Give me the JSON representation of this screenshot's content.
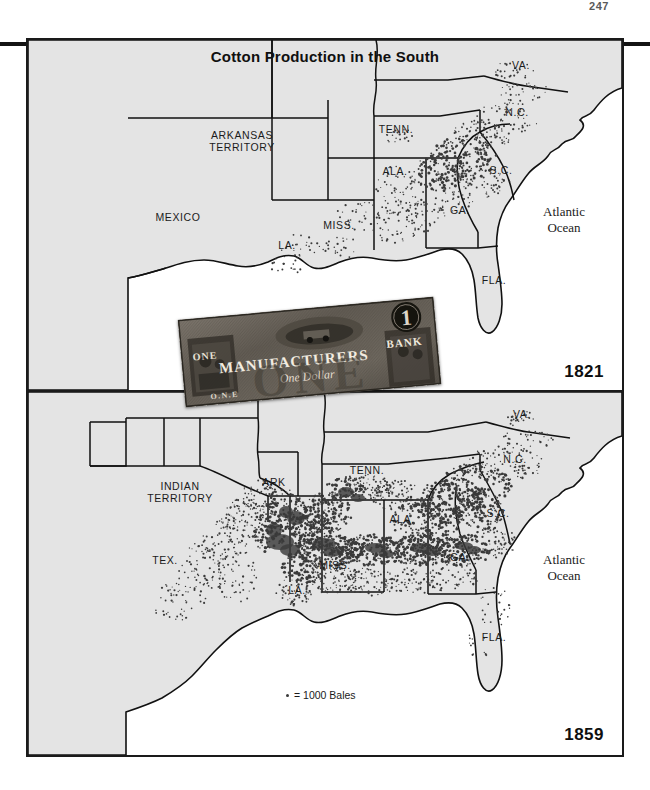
{
  "page": {
    "number": "247"
  },
  "figure": {
    "title": "Cotton Production in the South",
    "legend": {
      "symbol": "dot",
      "text": "= 1000 Bales"
    }
  },
  "maps": [
    {
      "year_label": "1821",
      "ocean_label_line1": "Atlantic",
      "ocean_label_line2": "Ocean",
      "labels": [
        {
          "id": "arkansas-territory",
          "line1": "ARKANSAS",
          "line2": "TERRITORY",
          "x": 214,
          "y": 99
        },
        {
          "id": "mexico",
          "line1": "MEXICO",
          "line2": "",
          "x": 150,
          "y": 181
        },
        {
          "id": "tennessee",
          "line1": "TENN.",
          "line2": "",
          "x": 368,
          "y": 93
        },
        {
          "id": "alabama",
          "line1": "ALA.",
          "line2": "",
          "x": 367,
          "y": 135
        },
        {
          "id": "mississippi",
          "line1": "MISS.",
          "line2": "",
          "x": 311,
          "y": 189
        },
        {
          "id": "louisiana",
          "line1": "LA.",
          "line2": "",
          "x": 259,
          "y": 209
        },
        {
          "id": "georgia",
          "line1": "GA.",
          "line2": "",
          "x": 432,
          "y": 174
        },
        {
          "id": "south-carolina",
          "line1": "S.C.",
          "line2": "",
          "x": 473,
          "y": 134
        },
        {
          "id": "north-carolina",
          "line1": "N.C.",
          "line2": "",
          "x": 489,
          "y": 76
        },
        {
          "id": "virginia",
          "line1": "VA.",
          "line2": "",
          "x": 493,
          "y": 29
        },
        {
          "id": "florida",
          "line1": "FLA.",
          "line2": "",
          "x": 466,
          "y": 244
        }
      ]
    },
    {
      "year_label": "1859",
      "ocean_label_line1": "Atlantic",
      "ocean_label_line2": "Ocean",
      "labels": [
        {
          "id": "indian-territory",
          "line1": "INDIAN",
          "line2": "TERRITORY",
          "x": 152,
          "y": 98
        },
        {
          "id": "texas",
          "line1": "TEX.",
          "line2": "",
          "x": 137,
          "y": 172
        },
        {
          "id": "arkansas",
          "line1": "ARK",
          "line2": "",
          "x": 246,
          "y": 94
        },
        {
          "id": "tennessee",
          "line1": "TENN.",
          "line2": "",
          "x": 339,
          "y": 82
        },
        {
          "id": "alabama",
          "line1": "ALA.",
          "line2": "",
          "x": 374,
          "y": 131
        },
        {
          "id": "mississippi",
          "line1": "MISS.",
          "line2": "",
          "x": 307,
          "y": 177
        },
        {
          "id": "louisiana",
          "line1": "LA.",
          "line2": "",
          "x": 269,
          "y": 202
        },
        {
          "id": "georgia",
          "line1": "GA.",
          "line2": "",
          "x": 432,
          "y": 169
        },
        {
          "id": "south-carolina",
          "line1": "S.C.",
          "line2": "",
          "x": 470,
          "y": 125
        },
        {
          "id": "north-carolina",
          "line1": "N.C.",
          "line2": "",
          "x": 487,
          "y": 71
        },
        {
          "id": "virginia",
          "line1": "VA.",
          "line2": "",
          "x": 494,
          "y": 26
        },
        {
          "id": "florida",
          "line1": "FLA.",
          "line2": "",
          "x": 466,
          "y": 249
        }
      ]
    }
  ],
  "banknote": {
    "title": "MANUFACTURERS",
    "bank_word": "BANK",
    "denomination_numeral": "1",
    "denomination_word": "ONE",
    "denomination_script": "One Dollar",
    "bottom_word": "O.N.E"
  },
  "colors": {
    "land": "#e4e4e4",
    "ink": "#111111",
    "dot": "#3a3a3a",
    "frame": "#1a1a1a",
    "note_paper": "#6f6a62"
  }
}
